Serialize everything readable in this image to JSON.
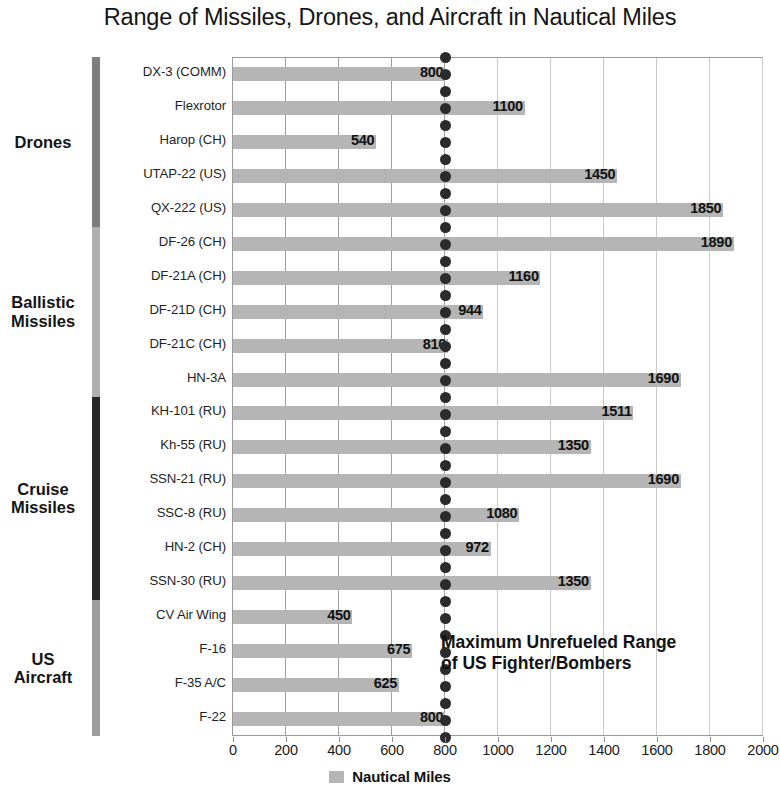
{
  "chart_data": {
    "type": "bar",
    "orientation": "horizontal",
    "title": "Range of Missiles, Drones, and Aircraft in Nautical Miles",
    "xlabel": "",
    "ylabel": "",
    "xlim": [
      0,
      2000
    ],
    "xticks": [
      0,
      200,
      400,
      600,
      800,
      1000,
      1200,
      1400,
      1600,
      1800,
      2000
    ],
    "grid": true,
    "grid_axis": "x",
    "legend": {
      "position": "bottom-center",
      "entries": [
        "Nautical Miles"
      ]
    },
    "series_name": "Nautical Miles",
    "bar_color": "#b5b5b5",
    "categories": [
      "DX-3 (COMM)",
      "Flexrotor",
      "Harop (CH)",
      "UTAP-22 (US)",
      "QX-222 (US)",
      "DF-26 (CH)",
      "DF-21A (CH)",
      "DF-21D (CH)",
      "DF-21C (CH)",
      "HN-3A",
      "KH-101 (RU)",
      "Kh-55 (RU)",
      "SSN-21 (RU)",
      "SSC-8 (RU)",
      "HN-2 (CH)",
      "SSN-30 (RU)",
      "CV Air Wing",
      "F-16",
      "F-35 A/C",
      "F-22"
    ],
    "values": [
      800,
      1100,
      540,
      1450,
      1850,
      1890,
      1160,
      944,
      810,
      1690,
      1511,
      1350,
      1690,
      1080,
      972,
      1350,
      450,
      675,
      625,
      800
    ],
    "value_labels": [
      "800",
      "1100",
      "540",
      "1450",
      "1850",
      "1890",
      "1160",
      "944",
      "810",
      "1690",
      "1511",
      "1350",
      "1690",
      "1080",
      "972",
      "1350",
      "450",
      "675",
      "625",
      "800"
    ],
    "annotations": [
      {
        "text_line1": "Maximum Unrefueled Range",
        "text_line2": "of US Fighter/Bombers",
        "marker_value": 800,
        "marker_style": "dotted-vertical"
      }
    ],
    "groups": [
      {
        "label": "Drones",
        "start_index": 0,
        "end_index": 4,
        "color": "#7e7e7e"
      },
      {
        "label_line1": "Ballistic",
        "label_line2": "Missiles",
        "label": "Ballistic Missiles",
        "start_index": 5,
        "end_index": 9,
        "color": "#b0b0b0"
      },
      {
        "label_line1": "Cruise",
        "label_line2": "Missiles",
        "label": "Cruise Missiles",
        "start_index": 10,
        "end_index": 15,
        "color": "#262626"
      },
      {
        "label_line1": "US",
        "label_line2": "Aircraft",
        "label": "US Aircraft",
        "start_index": 16,
        "end_index": 19,
        "color": "#9d9d9d"
      }
    ]
  },
  "title": {
    "text": "Range of Missiles, Drones, and Aircraft in Nautical Miles"
  },
  "legend": {
    "swatch_name": "nautical-miles-swatch",
    "label": "Nautical Miles"
  },
  "annotation": {
    "line1": "Maximum Unrefueled Range",
    "line2": "of US Fighter/Bombers"
  }
}
